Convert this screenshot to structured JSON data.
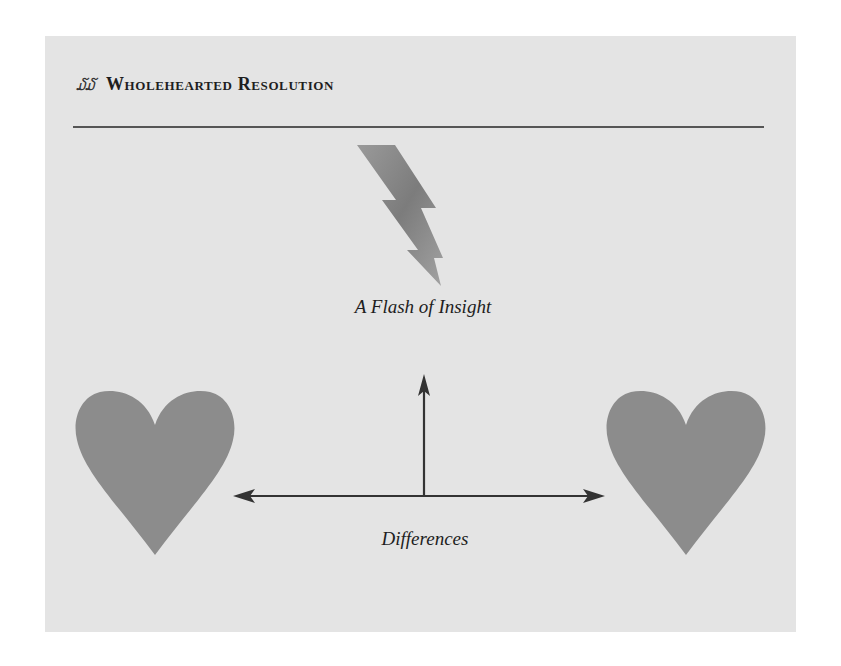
{
  "header": {
    "ornament": "໓໓",
    "title": "Wholehearted Resolution"
  },
  "diagram": {
    "top_label": "A Flash of Insight",
    "bottom_label": "Differences",
    "elements": {
      "lightning_bolt": "lightning-bolt-icon",
      "left_heart": "heart-icon",
      "right_heart": "heart-icon",
      "vertical_arrow": "arrow-up",
      "horizontal_arrow": "double-headed-arrow"
    },
    "colors": {
      "panel": "#e4e4e4",
      "heart": "#8c8c8c",
      "bolt": "#8a8a8a",
      "arrow": "#333333",
      "text": "#1e1e1e"
    }
  }
}
